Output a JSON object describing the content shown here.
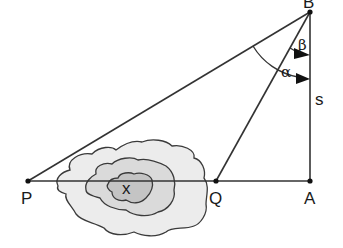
{
  "diagram": {
    "type": "triangulation-geometry",
    "points": {
      "B": {
        "label": "B",
        "x": 310,
        "y": 12
      },
      "A": {
        "label": "A",
        "x": 310,
        "y": 181
      },
      "Q": {
        "label": "Q",
        "x": 216,
        "y": 181
      },
      "P": {
        "label": "P",
        "x": 28,
        "y": 181
      }
    },
    "segments": [
      {
        "from": "B",
        "to": "P"
      },
      {
        "from": "B",
        "to": "Q"
      },
      {
        "from": "B",
        "to": "A",
        "label": "s"
      },
      {
        "from": "P",
        "to": "A"
      }
    ],
    "angles": {
      "alpha": {
        "label": "α",
        "between": [
          "BP",
          "BA"
        ]
      },
      "beta": {
        "label": "β",
        "between": [
          "BQ",
          "BA"
        ]
      }
    },
    "region": {
      "label": "x",
      "description": "contour lines of obstacle (lake/hill) between P and Q"
    },
    "colors": {
      "line": "#333333",
      "contour_outer": "#ececec",
      "contour_mid": "#dcdcdc",
      "contour_inner": "#c4c4c4"
    }
  },
  "labels": {
    "B": "B",
    "A": "A",
    "Q": "Q",
    "P": "P",
    "s": "s",
    "alpha": "α",
    "beta": "β",
    "x": "x"
  }
}
